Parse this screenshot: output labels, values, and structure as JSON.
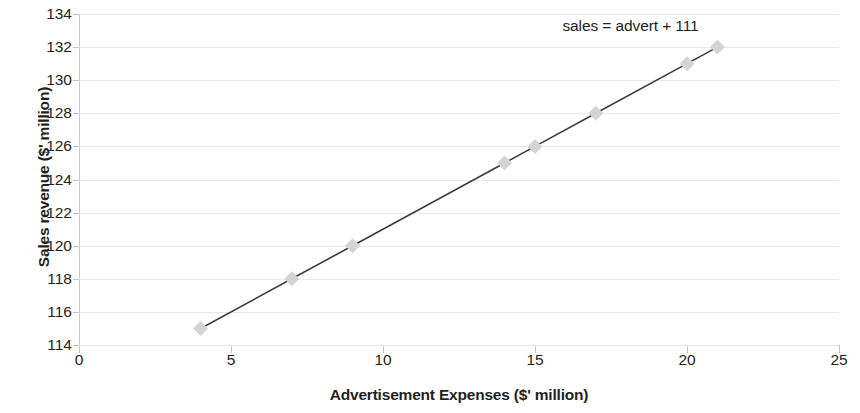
{
  "chart_data": {
    "type": "line",
    "title": "",
    "subtitle": "",
    "xlabel": "Advertisement Expenses ($' million)",
    "ylabel": "Sales revenue ($' million)",
    "xlim": [
      0,
      25
    ],
    "ylim": [
      114,
      134
    ],
    "xticks": [
      0,
      5,
      10,
      15,
      20,
      25
    ],
    "yticks": [
      114,
      116,
      118,
      120,
      122,
      124,
      126,
      128,
      130,
      132,
      134
    ],
    "grid": "horizontal",
    "legend": "none",
    "annotations": [
      {
        "text": "sales = advert + 111",
        "x": 21,
        "y": 133.2
      }
    ],
    "series": [
      {
        "name": "sales",
        "marker": "diamond",
        "marker_color": "#d4d4d6",
        "line_color": "#3d3d3f",
        "x": [
          4,
          7,
          9,
          14,
          15,
          17,
          20,
          21
        ],
        "values": [
          115,
          118,
          120,
          125,
          126,
          128,
          131,
          132
        ],
        "points": [
          {
            "x": 4,
            "y": 115
          },
          {
            "x": 7,
            "y": 118
          },
          {
            "x": 9,
            "y": 120
          },
          {
            "x": 14,
            "y": 125
          },
          {
            "x": 15,
            "y": 126
          },
          {
            "x": 17,
            "y": 128
          },
          {
            "x": 20,
            "y": 131
          },
          {
            "x": 21,
            "y": 132
          }
        ]
      }
    ]
  },
  "colors": {
    "line": "#3d3d3f",
    "marker": "#d4d4d6",
    "grid": "#e8e8ea",
    "axis": "#c3c3c6",
    "text": "#231f20",
    "background": "#ffffff"
  }
}
